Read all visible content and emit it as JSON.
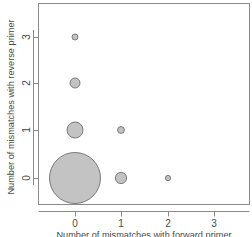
{
  "chart_data": {
    "type": "scatter",
    "title": "",
    "subtitle": "",
    "xlabel": "Number of mismatches with forward primer",
    "ylabel": "Number of mismatches with reverse primer",
    "xticks": [
      0,
      1,
      2,
      3
    ],
    "xtick_labels": [
      "0",
      "1",
      "2",
      "3"
    ],
    "yticks": [
      0,
      1,
      2,
      3
    ],
    "ytick_labels": [
      "0",
      "1",
      "2",
      "3"
    ],
    "xlim": [
      -0.35,
      3.35
    ],
    "ylim": [
      -0.35,
      3.35
    ],
    "grid": false,
    "legend": null,
    "marker_style": {
      "shape": "circle",
      "fill_color": "#c3c3c3",
      "edge_color": "#6e6e6e",
      "edge_width": 0.9,
      "size_encoding": "area proportional to count"
    },
    "points": [
      {
        "label": "p-0-0",
        "x": 0,
        "y": 0,
        "radius_px": 25.5,
        "size_rank": 1
      },
      {
        "label": "p-0-1",
        "x": 0,
        "y": 1,
        "radius_px": 8.0,
        "size_rank": 2
      },
      {
        "label": "p-1-0",
        "x": 1,
        "y": 0,
        "radius_px": 5.6,
        "size_rank": 3
      },
      {
        "label": "p-0-2",
        "x": 0,
        "y": 2,
        "radius_px": 5.0,
        "size_rank": 4
      },
      {
        "label": "p-1-1",
        "x": 1,
        "y": 1,
        "radius_px": 3.4,
        "size_rank": 5
      },
      {
        "label": "p-0-3",
        "x": 0,
        "y": 3,
        "radius_px": 3.0,
        "size_rank": 6
      },
      {
        "label": "p-2-0",
        "x": 2,
        "y": 0,
        "radius_px": 2.6,
        "size_rank": 7
      }
    ]
  },
  "plot_frame": {
    "left_px": 38,
    "right_px": 250,
    "top_px": 3,
    "bottom_px": 205,
    "border_color": "#888888"
  },
  "axis_pixel_map": {
    "x": {
      "0": 75,
      "1": 121,
      "2": 168,
      "3": 214
    },
    "y": {
      "0": 178,
      "1": 130,
      "2": 83,
      "3": 37
    }
  }
}
